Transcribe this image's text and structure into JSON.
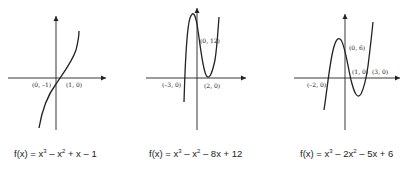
{
  "graphs": [
    {
      "function": "f(x) = x³ – x² + x – 1",
      "eq_parts": [
        "f(x) = x",
        "3",
        " – x",
        "2",
        " + x – 1"
      ],
      "points": [
        "(0, –1)",
        "(1, 0)"
      ]
    },
    {
      "function": "f(x) = x³ – x² – 8x + 12",
      "eq_parts": [
        "f(x) = x",
        "3",
        " – x",
        "2",
        " – 8x + 12"
      ],
      "points": [
        "(–3, 0)",
        "(0, 12)",
        "(2, 0)"
      ]
    },
    {
      "function": "f(x) = x³ – 2x² – 5x + 6",
      "eq_parts": [
        "f(x) = x",
        "3",
        " – 2x",
        "2",
        " – 5x + 6"
      ],
      "points": [
        "(–2, 0)",
        "(0, 6)",
        "(1, 0)",
        "(3, 0)"
      ]
    }
  ]
}
